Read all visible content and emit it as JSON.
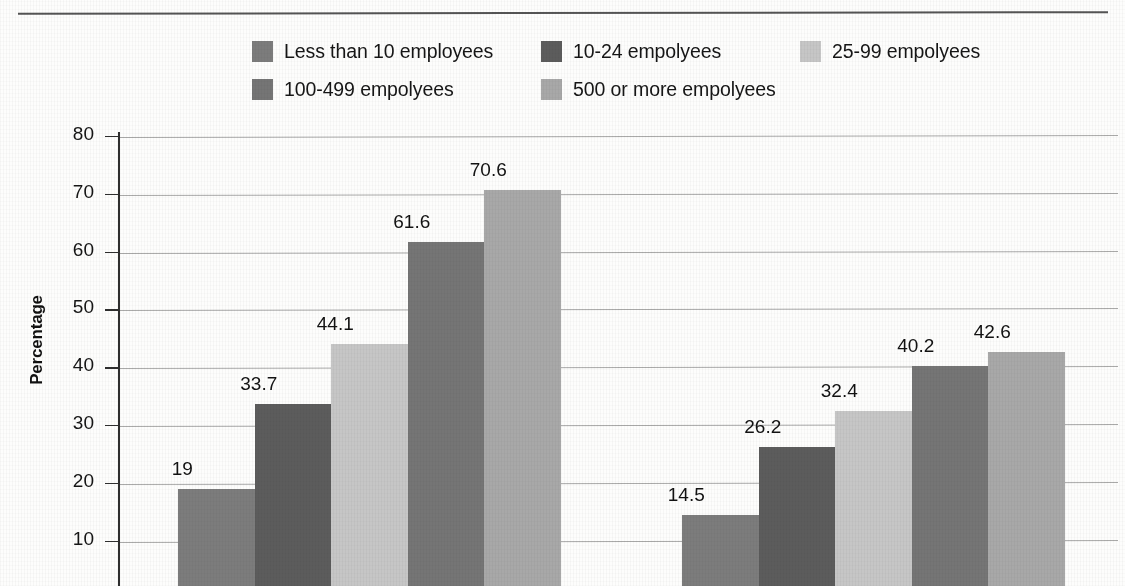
{
  "page": {
    "top_clipped_text": "",
    "background": "#fdfdfc"
  },
  "legend": {
    "items": [
      {
        "label": "Less than 10 employees",
        "color": "#7c7c7c",
        "row": 0,
        "x": 252
      },
      {
        "label": "10-24 empolyees",
        "color": "#5c5c5c",
        "row": 0,
        "x": 541
      },
      {
        "label": "25-99 empolyees",
        "color": "#c6c6c6",
        "row": 0,
        "x": 800
      },
      {
        "label": "100-499 empolyees",
        "color": "#757575",
        "row": 1,
        "x": 252
      },
      {
        "label": "500 or more empolyees",
        "color": "#a8a8a8",
        "row": 1,
        "x": 541
      }
    ]
  },
  "axis": {
    "y_title": "Percentage",
    "y_ticks": [
      "80",
      "70",
      "60",
      "50",
      "40",
      "30",
      "20",
      "10"
    ]
  },
  "chart_data": {
    "type": "bar",
    "title": "",
    "xlabel": "",
    "ylabel": "Percentage",
    "ylim": [
      0,
      80
    ],
    "ytick_values": [
      10,
      20,
      30,
      40,
      50,
      60,
      70,
      80
    ],
    "grid": true,
    "legend_position": "top",
    "categories": [
      "Group 1",
      "Group 2"
    ],
    "series": [
      {
        "name": "Less than 10 employees",
        "color": "#7c7c7c",
        "values": [
          19,
          14.5
        ],
        "labels": [
          "19",
          "14.5"
        ]
      },
      {
        "name": "10-24 empolyees",
        "color": "#5c5c5c",
        "values": [
          33.7,
          26.2
        ],
        "labels": [
          "33.7",
          "26.2"
        ]
      },
      {
        "name": "25-99 empolyees",
        "color": "#c6c6c6",
        "values": [
          44.1,
          32.4
        ],
        "labels": [
          "44.1",
          "32.4"
        ]
      },
      {
        "name": "100-499 empolyees",
        "color": "#757575",
        "values": [
          61.6,
          40.2
        ],
        "labels": [
          "61.6",
          "40.2"
        ]
      },
      {
        "name": "500 or more empolyees",
        "color": "#a8a8a8",
        "values": [
          70.6,
          42.6
        ],
        "labels": [
          "70.6",
          "42.6"
        ]
      }
    ]
  }
}
